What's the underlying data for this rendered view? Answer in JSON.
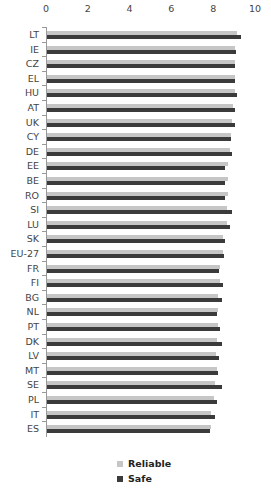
{
  "chart_data": {
    "type": "bar",
    "orientation": "horizontal",
    "title": "",
    "xlabel": "",
    "ylabel": "",
    "xlim": [
      0,
      10
    ],
    "x_ticks": [
      "0",
      "2",
      "4",
      "6",
      "8",
      "10"
    ],
    "x_axis_position": "top",
    "grid": false,
    "legend_position": "bottom",
    "categories": [
      "LT",
      "IE",
      "CZ",
      "EL",
      "HU",
      "AT",
      "UK",
      "CY",
      "DE",
      "EE",
      "BE",
      "RO",
      "SI",
      "LU",
      "SK",
      "EU-27",
      "FR",
      "FI",
      "BG",
      "NL",
      "PT",
      "DK",
      "LV",
      "MT",
      "SE",
      "PL",
      "IT",
      "ES"
    ],
    "series": [
      {
        "name": "Reliable",
        "color": "#c6c6c6",
        "values": [
          9.1,
          9.0,
          9.0,
          9.0,
          9.0,
          8.9,
          8.85,
          8.8,
          8.75,
          8.65,
          8.65,
          8.65,
          8.6,
          8.6,
          8.4,
          8.4,
          8.3,
          8.3,
          8.2,
          8.2,
          8.2,
          8.15,
          8.1,
          8.15,
          8.05,
          8.0,
          7.85,
          7.85
        ]
      },
      {
        "name": "Safe",
        "color": "#3b3b3b",
        "values": [
          9.3,
          9.05,
          9.0,
          9.0,
          9.1,
          9.0,
          9.0,
          8.8,
          8.85,
          8.5,
          8.5,
          8.5,
          8.85,
          8.75,
          8.5,
          8.45,
          8.25,
          8.4,
          8.35,
          8.15,
          8.3,
          8.35,
          8.25,
          8.2,
          8.35,
          8.15,
          8.05,
          7.8
        ]
      }
    ]
  },
  "legend": {
    "items": [
      {
        "label": "Reliable",
        "color": "#c6c6c6"
      },
      {
        "label": "Safe",
        "color": "#3b3b3b"
      }
    ]
  }
}
